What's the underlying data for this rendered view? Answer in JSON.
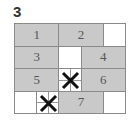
{
  "puzzle": {
    "number": "3",
    "columns": 5,
    "rows": 4,
    "cells": [
      {
        "type": "piece",
        "label": "1",
        "col": 0,
        "row": 0,
        "colspan": 2
      },
      {
        "type": "piece",
        "label": "2",
        "col": 2,
        "row": 0,
        "colspan": 2
      },
      {
        "type": "empty",
        "label": "",
        "col": 4,
        "row": 0,
        "colspan": 1
      },
      {
        "type": "piece",
        "label": "3",
        "col": 0,
        "row": 1,
        "colspan": 2
      },
      {
        "type": "empty",
        "label": "",
        "col": 2,
        "row": 1,
        "colspan": 1
      },
      {
        "type": "piece",
        "label": "4",
        "col": 3,
        "row": 1,
        "colspan": 2
      },
      {
        "type": "piece",
        "label": "5",
        "col": 0,
        "row": 2,
        "colspan": 2
      },
      {
        "type": "blocked",
        "label": "",
        "col": 2,
        "row": 2,
        "colspan": 1
      },
      {
        "type": "piece",
        "label": "6",
        "col": 3,
        "row": 2,
        "colspan": 2
      },
      {
        "type": "empty",
        "label": "",
        "col": 0,
        "row": 3,
        "colspan": 1
      },
      {
        "type": "blocked",
        "label": "",
        "col": 1,
        "row": 3,
        "colspan": 1
      },
      {
        "type": "piece",
        "label": "7",
        "col": 2,
        "row": 3,
        "colspan": 2
      },
      {
        "type": "empty",
        "label": "",
        "col": 4,
        "row": 3,
        "colspan": 1
      }
    ],
    "colors": {
      "piece_fill": "#c9c9c9",
      "border": "#8a8a8a",
      "cross_mark": "#111111"
    }
  }
}
